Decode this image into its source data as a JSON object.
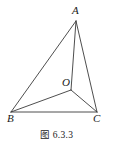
{
  "figure": {
    "caption": "图 6.3.3",
    "background_color": "#ffffff",
    "stroke_color": "#3a3a3a",
    "label_color": "#1a1a1a"
  },
  "diagram": {
    "type": "geometry-line-drawing",
    "vertices": [
      {
        "id": "A",
        "label": "A",
        "x": 76,
        "y": 21
      },
      {
        "id": "B",
        "label": "B",
        "x": 11,
        "y": 112
      },
      {
        "id": "C",
        "label": "C",
        "x": 97,
        "y": 112
      },
      {
        "id": "O",
        "label": "O",
        "x": 71,
        "y": 90
      }
    ],
    "edges": [
      {
        "id": "AB",
        "from": "A",
        "to": "B"
      },
      {
        "id": "AC",
        "from": "A",
        "to": "C"
      },
      {
        "id": "BC",
        "from": "B",
        "to": "C"
      },
      {
        "id": "AO",
        "from": "A",
        "to": "O"
      },
      {
        "id": "BO",
        "from": "B",
        "to": "O"
      },
      {
        "id": "CO",
        "from": "C",
        "to": "O"
      }
    ]
  },
  "labels": {
    "A": "A",
    "B": "B",
    "C": "C",
    "O": "O"
  }
}
